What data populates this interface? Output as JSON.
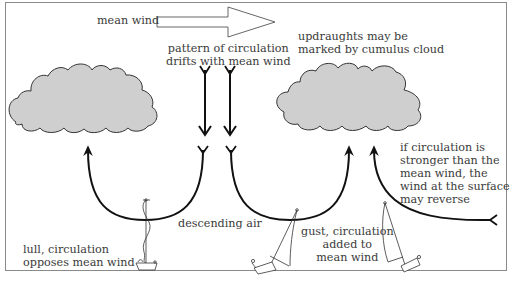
{
  "diagram": {
    "colors": {
      "frame": "#8a8a8a",
      "cloud_fill": "#cfcfcf",
      "cloud_stroke": "#333333",
      "arrow": "#111111",
      "text": "#3a3a3a",
      "boat": "#333333"
    },
    "labels": {
      "mean_wind": "mean wind",
      "pattern": [
        "pattern of circulation",
        "drifts with mean wind"
      ],
      "updraughts": [
        "updraughts may be",
        "marked by cumulus cloud"
      ],
      "descending": "descending air",
      "lull": [
        "lull, circulation",
        "opposes mean wind"
      ],
      "gust": [
        "gust, circulation",
        "added to",
        "mean wind"
      ],
      "reverse": [
        "if circulation is",
        "stronger than the",
        "mean wind, the",
        "wind at the surface",
        "may reverse"
      ]
    },
    "elements": {
      "mean_wind_arrow": "hollow-right-arrow",
      "clouds": [
        "cumulus-cloud-left",
        "cumulus-cloud-right"
      ],
      "down_arrows": [
        "downdraught-arrow-1",
        "downdraught-arrow-2"
      ],
      "circulation_arcs": [
        "arc-left-updraught",
        "arc-middle-gust",
        "arc-right-reverse"
      ],
      "boats": [
        "dinghy-lull-upright",
        "dinghy-gust-heeled",
        "dinghy-reverse-heeled"
      ]
    }
  }
}
